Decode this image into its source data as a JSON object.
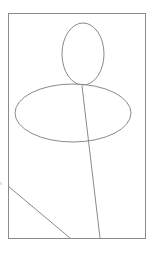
{
  "canvas": {
    "width": 163,
    "height": 259,
    "background": "#ffffff"
  },
  "stroke": {
    "color": "#8a8a8a",
    "width": 1
  },
  "frame": {
    "x": 8,
    "y": 13,
    "width": 137,
    "height": 225
  },
  "shapes": {
    "head_ellipse": {
      "cx": 83,
      "cy": 54,
      "rx": 21,
      "ry": 31
    },
    "body_ellipse": {
      "cx": 73,
      "cy": 113,
      "rx": 58,
      "ry": 29
    },
    "vertical_line": {
      "x1": 82,
      "y1": 86,
      "x2": 100,
      "y2": 238
    },
    "diagonal_line": {
      "x1": 8,
      "y1": 186,
      "x2": 70,
      "y2": 238
    },
    "left_tick": {
      "x1": 1,
      "y1": 182,
      "x2": 1,
      "y2": 185
    }
  }
}
